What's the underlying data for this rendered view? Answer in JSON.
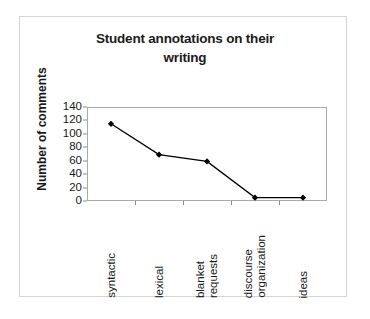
{
  "chart_data": {
    "type": "line",
    "title": "Student annotations on their writing",
    "title_lines": [
      "Student annotations on their",
      "writing"
    ],
    "xlabel": "",
    "ylabel": "Number of comments",
    "categories": [
      "syntactic",
      "lexical",
      "blanket requests",
      "discourse organization",
      "ideas"
    ],
    "category_lines": [
      [
        "syntactic"
      ],
      [
        "lexical"
      ],
      [
        "blanket",
        "requests"
      ],
      [
        "discourse",
        "organization"
      ],
      [
        "ideas"
      ]
    ],
    "values": [
      115,
      69,
      59,
      5,
      5
    ],
    "ylim": [
      0,
      140
    ],
    "ytick_labels": [
      "0",
      "20",
      "40",
      "60",
      "80",
      "100",
      "120",
      "140"
    ],
    "ytick_values": [
      0,
      20,
      40,
      60,
      80,
      100,
      120,
      140
    ],
    "grid": false,
    "legend": "none",
    "series_color": "#000000",
    "marker": "diamond",
    "frame_color": "#aaaaaa",
    "border_color": "#d4d4d4",
    "background": "#ffffff"
  }
}
